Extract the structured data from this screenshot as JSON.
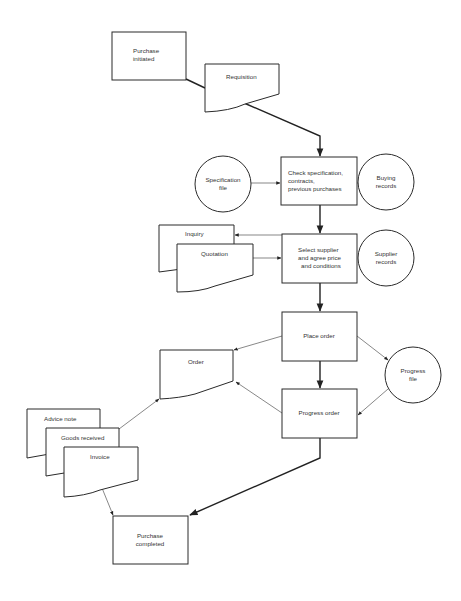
{
  "diagram": {
    "type": "flowchart",
    "title": "",
    "colors": {
      "stroke": "#2a2a2a",
      "text": "#333333",
      "background": "#ffffff"
    },
    "nodes": {
      "purchase_initiated": {
        "shape": "process-box",
        "line1": "Purchase",
        "line2": "initiated"
      },
      "requisition": {
        "shape": "document",
        "label": "Requisition"
      },
      "check_spec": {
        "shape": "process-box",
        "line1": "Check specification,",
        "line2": "contracts,",
        "line3": "previous purchases"
      },
      "spec_file": {
        "shape": "file-circle",
        "line1": "Specification",
        "line2": "file"
      },
      "buying_records": {
        "shape": "file-circle",
        "line1": "Buying",
        "line2": "records"
      },
      "inquiry": {
        "shape": "document",
        "label": "Inquiry"
      },
      "quotation": {
        "shape": "document",
        "label": "Quotation"
      },
      "select_supplier": {
        "shape": "process-box",
        "line1": "Select supplier",
        "line2": "and agree price",
        "line3": "and conditions"
      },
      "supplier_records": {
        "shape": "file-circle",
        "line1": "Supplier",
        "line2": "records"
      },
      "place_order": {
        "shape": "process-box",
        "label": "Place order"
      },
      "order": {
        "shape": "document",
        "label": "Order"
      },
      "progress_file": {
        "shape": "file-circle",
        "line1": "Progress",
        "line2": "file"
      },
      "progress_order": {
        "shape": "process-box",
        "label": "Progress order"
      },
      "advice_note": {
        "shape": "document",
        "label": "Advice note"
      },
      "goods_received": {
        "shape": "document",
        "label": "Goods received"
      },
      "invoice": {
        "shape": "document",
        "label": "Invoice"
      },
      "purchase_completed": {
        "shape": "process-box",
        "line1": "Purchase",
        "line2": "completed"
      }
    },
    "edges": [
      {
        "from": "Purchase initiated",
        "to": "Requisition"
      },
      {
        "from": "Requisition",
        "to": "Check specification, contracts, previous purchases"
      },
      {
        "from": "Specification file",
        "to": "Check specification, contracts, previous purchases"
      },
      {
        "from": "Buying records",
        "to": "Check specification, contracts, previous purchases"
      },
      {
        "from": "Check specification, contracts, previous purchases",
        "to": "Select supplier and agree price and conditions"
      },
      {
        "from": "Select supplier and agree price and conditions",
        "to": "Inquiry"
      },
      {
        "from": "Quotation",
        "to": "Select supplier and agree price and conditions"
      },
      {
        "from": "Supplier records",
        "to": "Select supplier and agree price and conditions"
      },
      {
        "from": "Select supplier and agree price and conditions",
        "to": "Place order"
      },
      {
        "from": "Place order",
        "to": "Order"
      },
      {
        "from": "Place order",
        "to": "Progress file"
      },
      {
        "from": "Place order",
        "to": "Progress order"
      },
      {
        "from": "Progress file",
        "to": "Progress order"
      },
      {
        "from": "Progress order",
        "to": "Order"
      },
      {
        "from": "Goods received",
        "to": "Order"
      },
      {
        "from": "Invoice",
        "to": "Purchase completed"
      },
      {
        "from": "Progress order",
        "to": "Purchase completed"
      }
    ]
  }
}
